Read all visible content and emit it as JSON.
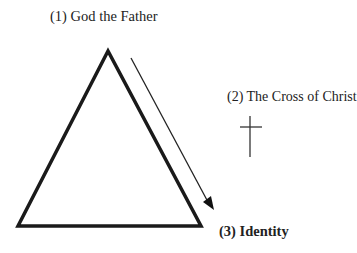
{
  "labels": {
    "father": "(1) God the Father",
    "cross": "(2) The Cross of Christ",
    "identity": "(3) Identity"
  },
  "icons": {
    "cross": "latin-cross",
    "arrow": "down-right-arrow"
  }
}
